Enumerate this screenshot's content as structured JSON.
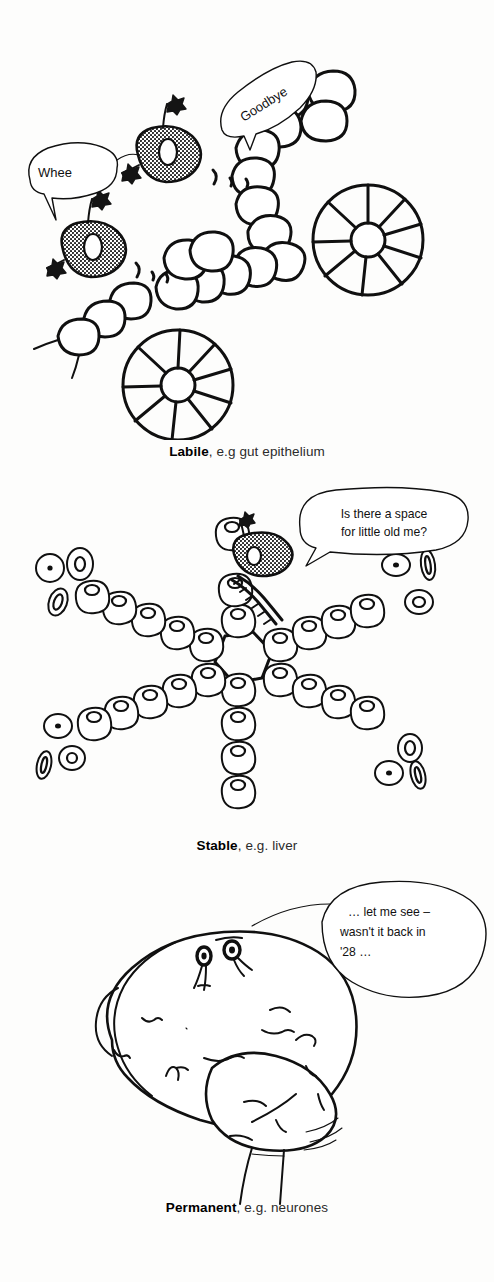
{
  "document": {
    "title": "Cell population types",
    "background_color": "#fdfdfc",
    "ink_color": "#101010"
  },
  "panels": [
    {
      "id": "labile",
      "caption_term": "Labile",
      "caption_rest": ", e.g gut epithelium",
      "subject": "gut epithelium with crypts and migrating stem cells",
      "speech_bubbles": [
        {
          "id": "whee",
          "text": "Whee",
          "rotation_deg": 0
        },
        {
          "id": "goodbye",
          "text": "Goodbye",
          "rotation_deg": -32
        }
      ],
      "motion_marks": ") , ,",
      "stem_cell_count": 2,
      "rosette_count": 2,
      "rosette_wedges": 9
    },
    {
      "id": "stable",
      "caption_term": "Stable",
      "caption_rest": ", e.g. liver",
      "subject": "liver lobule with radiating hepatocyte cords and red blood cells",
      "speech_bubbles": [
        {
          "id": "space-for-me",
          "line1": "Is there a space",
          "line2": "for little old me?",
          "rotation_deg": 0
        }
      ],
      "stem_cell_count": 1,
      "cord_count": 6
    },
    {
      "id": "permanent",
      "caption_term": "Permanent",
      "caption_rest": ", e.g. neurones",
      "subject": "brain with cerebrum, cerebellum and brainstem",
      "speech_bubbles": [
        {
          "id": "let-me-see",
          "line1": "… let me see –",
          "line2": "wasn't it back in",
          "line3": "'28 …",
          "rotation_deg": 0
        }
      ]
    }
  ]
}
